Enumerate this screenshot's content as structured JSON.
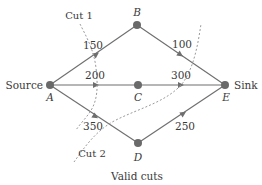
{
  "diagram": {
    "title": "Valid cuts",
    "colors": {
      "edge": "#6e6e6e",
      "node": "#6a6a6a",
      "cut": "#9a9a9a",
      "text": "#3a3a3a"
    },
    "terminals": {
      "source": "Source",
      "sink": "Sink"
    },
    "nodes": [
      {
        "id": "A",
        "label": "A",
        "x": 50,
        "y": 85
      },
      {
        "id": "B",
        "label": "B",
        "x": 137,
        "y": 25
      },
      {
        "id": "C",
        "label": "C",
        "x": 138,
        "y": 85
      },
      {
        "id": "D",
        "label": "D",
        "x": 138,
        "y": 143
      },
      {
        "id": "E",
        "label": "E",
        "x": 225,
        "y": 85
      }
    ],
    "edges": [
      {
        "from": "A",
        "to": "B",
        "capacity": "150"
      },
      {
        "from": "A",
        "to": "C",
        "capacity": "200"
      },
      {
        "from": "A",
        "to": "D",
        "capacity": "350"
      },
      {
        "from": "B",
        "to": "E",
        "capacity": "100"
      },
      {
        "from": "C",
        "to": "E",
        "capacity": "300"
      },
      {
        "from": "D",
        "to": "E",
        "capacity": "250"
      }
    ],
    "cuts": [
      {
        "label": "Cut 1",
        "crosses": [
          "150",
          "200",
          "350"
        ]
      },
      {
        "label": "Cut 2",
        "crosses": [
          "100",
          "300",
          "350"
        ]
      }
    ]
  }
}
